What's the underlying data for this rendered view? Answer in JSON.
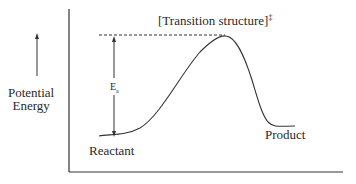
{
  "diagram": {
    "type": "energy_profile",
    "y_axis_label_line1": "Potential",
    "y_axis_label_line2": "Energy",
    "peak_label": "[Transition structure]",
    "peak_label_superscript": "‡",
    "activation_energy_label": "E",
    "activation_energy_subscript": "a",
    "start_label": "Reactant",
    "end_label": "Product",
    "colors": {
      "line": "#333333",
      "text": "#2a2a2a",
      "background": "#ffffff"
    }
  }
}
